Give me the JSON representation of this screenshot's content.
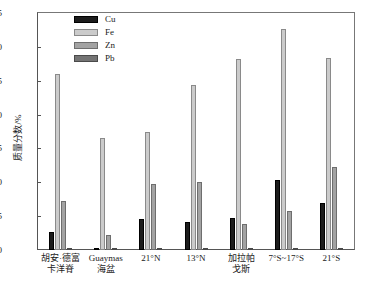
{
  "chart_data": {
    "type": "bar",
    "title": "",
    "xlabel": "",
    "ylabel": "质量分数/%",
    "ylim": [
      0,
      35
    ],
    "yticks": [
      0,
      5,
      10,
      15,
      20,
      25,
      30,
      35
    ],
    "grid": false,
    "legend_position": "top-left",
    "categories": [
      "胡安·德富\n卡洋脊",
      "Guaymas\n海盆",
      "21°N",
      "13°N",
      "加拉帕\n戈斯",
      "7°S~17°S",
      "21°S"
    ],
    "series": [
      {
        "name": "Cu",
        "color": "#1c1c1c",
        "values": [
          2.7,
          0.3,
          4.6,
          4.2,
          4.7,
          10.3,
          7.0
        ]
      },
      {
        "name": "Fe",
        "color": "#cbcbcb",
        "values": [
          26.0,
          16.6,
          17.5,
          24.4,
          28.2,
          32.7,
          28.4
        ]
      },
      {
        "name": "Zn",
        "color": "#a3a3a3",
        "values": [
          7.3,
          2.2,
          9.8,
          10.1,
          3.9,
          5.8,
          12.3
        ]
      },
      {
        "name": "Pb",
        "color": "#747474",
        "values": [
          0.35,
          0.35,
          0.1,
          0.1,
          0.1,
          0.3,
          0.1
        ]
      }
    ]
  }
}
